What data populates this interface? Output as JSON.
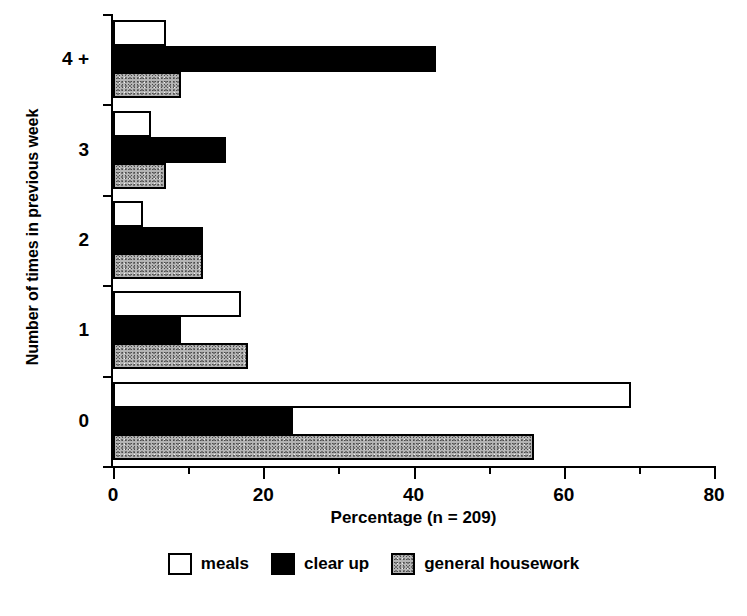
{
  "chart_data": {
    "type": "bar",
    "orientation": "horizontal",
    "title": "",
    "xlabel": "Percentage (n = 209)",
    "ylabel": "Number of times in previous week",
    "categories": [
      "0",
      "1",
      "2",
      "3",
      "4 +"
    ],
    "series": [
      {
        "name": "meals",
        "values": [
          69,
          17,
          4,
          5,
          7
        ],
        "fill": "white",
        "color": "#ffffff"
      },
      {
        "name": "clear up",
        "values": [
          24,
          9,
          12,
          15,
          43
        ],
        "fill": "black",
        "color": "#000000"
      },
      {
        "name": "general housework",
        "values": [
          56,
          18,
          12,
          7,
          9
        ],
        "fill": "stipple",
        "color": "#b4b4b4"
      }
    ],
    "xlim": [
      0,
      80
    ],
    "xticks": [
      0,
      20,
      40,
      60,
      80
    ],
    "xticks_minor": [
      10,
      30,
      50,
      70
    ],
    "xtick_labels": [
      "0",
      "20",
      "40",
      "60",
      "80"
    ],
    "grid": false,
    "legend_position": "bottom"
  },
  "legend": {
    "items": [
      {
        "label": "meals"
      },
      {
        "label": "clear up"
      },
      {
        "label": "general housework"
      }
    ]
  }
}
